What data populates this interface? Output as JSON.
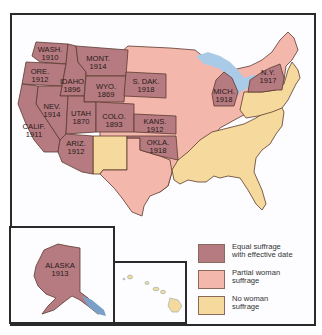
{
  "colors": {
    "equal": "#b57b80",
    "partial": "#f4b7ac",
    "none": "#f6d99c",
    "water": "#a9cbe8",
    "border": "#5a3a2e",
    "frame": "#2a2a2a"
  },
  "states": [
    {
      "abbr": "WASH.",
      "year": "1910",
      "category": "equal"
    },
    {
      "abbr": "ORE.",
      "year": "1912",
      "category": "equal"
    },
    {
      "abbr": "IDAHO",
      "year": "1896",
      "category": "equal"
    },
    {
      "abbr": "MONT.",
      "year": "1914",
      "category": "equal"
    },
    {
      "abbr": "WYO.",
      "year": "1869",
      "category": "equal"
    },
    {
      "abbr": "NEV.",
      "year": "1914",
      "category": "equal"
    },
    {
      "abbr": "UTAH",
      "year": "1870",
      "category": "equal"
    },
    {
      "abbr": "CALIF.",
      "year": "1911",
      "category": "equal"
    },
    {
      "abbr": "COLO.",
      "year": "1893",
      "category": "equal"
    },
    {
      "abbr": "ARIZ.",
      "year": "1912",
      "category": "equal"
    },
    {
      "abbr": "S. DAK.",
      "year": "1918",
      "category": "equal"
    },
    {
      "abbr": "KANS.",
      "year": "1912",
      "category": "equal"
    },
    {
      "abbr": "OKLA.",
      "year": "1918",
      "category": "equal"
    },
    {
      "abbr": "MICH.",
      "year": "1918",
      "category": "equal"
    },
    {
      "abbr": "N.Y.",
      "year": "1917",
      "category": "equal"
    },
    {
      "abbr": "ALASKA",
      "year": "1913",
      "category": "equal"
    }
  ],
  "legend": [
    {
      "category": "equal",
      "line1": "Equal suffrage",
      "line2": "with effective date"
    },
    {
      "category": "partial",
      "line1": "Partial woman",
      "line2": "suffrage"
    },
    {
      "category": "none",
      "line1": "No woman",
      "line2": "suffrage"
    }
  ]
}
